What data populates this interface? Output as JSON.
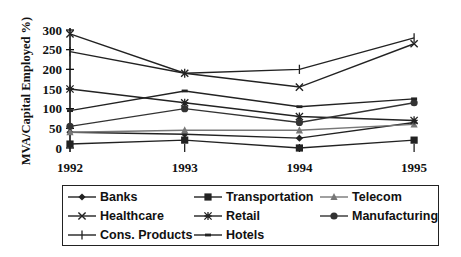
{
  "chart_data": {
    "type": "line",
    "title": "",
    "xlabel": "",
    "ylabel": "MVA/Capital Employed %)",
    "x": [
      "1992",
      "1993",
      "1994",
      "1995"
    ],
    "yticks": [
      0,
      50,
      100,
      150,
      200,
      250,
      300
    ],
    "ylim": [
      0,
      300
    ],
    "grid": false,
    "legend_position": "bottom",
    "series": [
      {
        "name": "Banks",
        "marker": "diamond",
        "color": "#222222",
        "values": [
          40,
          35,
          25,
          65
        ]
      },
      {
        "name": "Transportation",
        "marker": "square",
        "color": "#222222",
        "values": [
          10,
          20,
          0,
          20
        ]
      },
      {
        "name": "Telecom",
        "marker": "triangle",
        "color": "#777777",
        "values": [
          40,
          45,
          45,
          60
        ]
      },
      {
        "name": "Healthcare",
        "marker": "x",
        "color": "#222222",
        "values": [
          290,
          190,
          155,
          265
        ]
      },
      {
        "name": "Retail",
        "marker": "asterisk",
        "color": "#222222",
        "values": [
          150,
          115,
          80,
          70
        ]
      },
      {
        "name": "Manufacturing",
        "marker": "circle",
        "color": "#333333",
        "values": [
          55,
          100,
          65,
          115
        ]
      },
      {
        "name": "Cons. Products",
        "marker": "plus",
        "color": "#222222",
        "values": [
          245,
          190,
          200,
          280
        ]
      },
      {
        "name": "Hotels",
        "marker": "dash",
        "color": "#222222",
        "values": [
          95,
          145,
          105,
          125
        ]
      }
    ]
  },
  "legend": {
    "items": [
      "Banks",
      "Transportation",
      "Telecom",
      "Healthcare",
      "Retail",
      "Manufacturing",
      "Cons. Products",
      "Hotels"
    ]
  }
}
